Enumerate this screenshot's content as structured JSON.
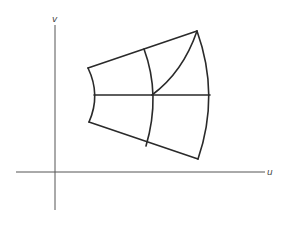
{
  "diagram": {
    "axes": {
      "vertical_label": "v",
      "horizontal_label": "u"
    },
    "colors": {
      "axis": "#555555",
      "edge": "#2a2a2a",
      "background": "#ffffff"
    }
  }
}
